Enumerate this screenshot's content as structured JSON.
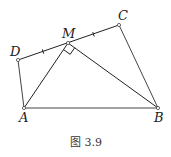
{
  "figure": {
    "caption": "图 3.9",
    "points": {
      "A": {
        "label": "A",
        "x": 24,
        "y": 108
      },
      "B": {
        "label": "B",
        "x": 158,
        "y": 108
      },
      "C": {
        "label": "C",
        "x": 119,
        "y": 25
      },
      "D": {
        "label": "D",
        "x": 18,
        "y": 60
      },
      "M": {
        "label": "M",
        "x": 68,
        "y": 43
      }
    },
    "segments": [
      "DC",
      "DA",
      "AB",
      "BC",
      "MA",
      "MB"
    ],
    "equal_marks": [
      "DM",
      "MC"
    ],
    "right_angle_at": "M",
    "right_angle_between": [
      "MA",
      "MB"
    ]
  }
}
